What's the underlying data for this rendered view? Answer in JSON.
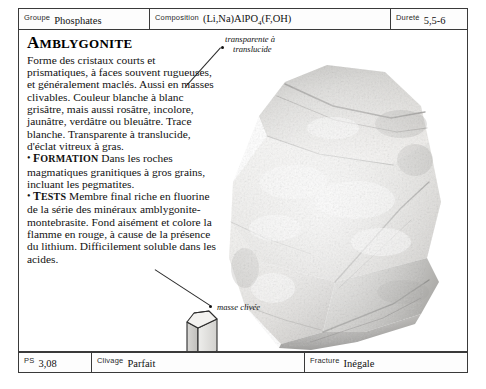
{
  "header": {
    "fields": [
      {
        "label": "Groupe",
        "value": "Phosphates"
      },
      {
        "label": "Composition",
        "value": "(Li,Na)AlPO4(F,OH)",
        "formula_main": "(Li,Na)AlPO",
        "formula_sub": "4",
        "formula_tail": "(F,OH)"
      },
      {
        "label": "Dureté",
        "value": "5,5-6"
      }
    ]
  },
  "footer": {
    "fields": [
      {
        "label": "PS",
        "value": "3,08"
      },
      {
        "label": "Clivage",
        "value": "Parfait"
      },
      {
        "label": "Fracture",
        "value": "Inégale"
      }
    ]
  },
  "main": {
    "title": "AMBLYGONITE",
    "title_cap": "A",
    "title_rest": "MBLYGONITE",
    "description": "Forme des cristaux courts et prismatiques, à faces souvent rugueuses, et généralement maclés. Aussi en masses clivables. Couleur blanche à blanc grisâtre, mais aussi rosâtre, incolore, jaunâtre, verdâtre ou bleuâtre. Trace blanche. Transparente à translucide, d'éclat vitreux à gras.",
    "sections": [
      {
        "keyword": "FORMATION",
        "keyword_cap": "F",
        "keyword_rest": "ORMATION",
        "text": "Dans les roches magmatiques granitiques à gros grains, incluant les pegmatites."
      },
      {
        "keyword": "TESTS",
        "keyword_cap": "T",
        "keyword_rest": "ESTS",
        "text": "Membre final riche en fluorine de la série des minéraux amblygonite-montebrasite. Fond aisément et colore la flamme en rouge, à cause de la présence du lithium. Difficilement soluble dans les acides."
      }
    ],
    "crystal_system": "TRICLINIQUE"
  },
  "photo": {
    "alt": "amblygonite-specimen",
    "annotations": [
      {
        "line1": "transparente à",
        "line2": "translucide"
      },
      {
        "line1": "masse clivée",
        "line2": ""
      }
    ]
  },
  "colors": {
    "frame": "#3a3a3a",
    "text": "#111111",
    "label": "#2a2a2a",
    "specimen_light": "#f2f1ef",
    "specimen_mid": "#d8d7d4",
    "specimen_dark": "#9a9a98"
  }
}
